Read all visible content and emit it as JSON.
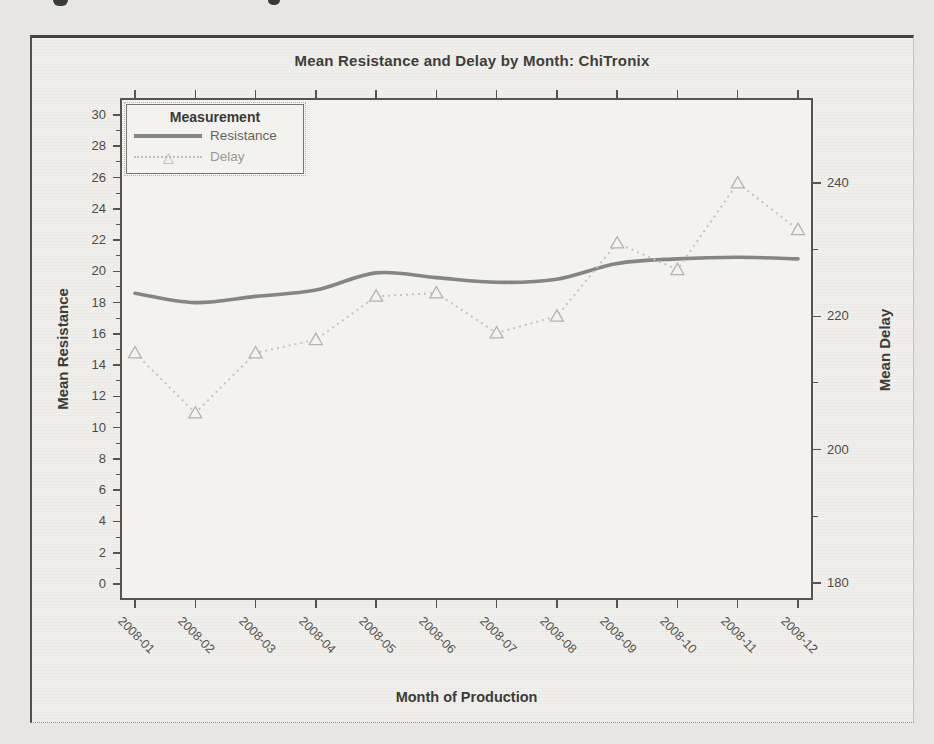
{
  "chart_data": {
    "type": "line",
    "title": "Mean Resistance and Delay by Month: ChiTronix",
    "xlabel": "Month of Production",
    "ylabel_left": "Mean Resistance",
    "ylabel_right": "Mean Delay",
    "categories": [
      "2008-01",
      "2008-02",
      "2008-03",
      "2008-04",
      "2008-05",
      "2008-06",
      "2008-07",
      "2008-08",
      "2008-09",
      "2008-10",
      "2008-11",
      "2008-12"
    ],
    "series": [
      {
        "name": "Resistance",
        "yaxis": "left",
        "line_style": "solid",
        "marker": "none",
        "color": "#858581",
        "values": [
          18.6,
          18.0,
          18.4,
          18.8,
          19.9,
          19.6,
          19.3,
          19.5,
          20.5,
          20.8,
          20.9,
          20.8
        ]
      },
      {
        "name": "Delay",
        "yaxis": "right",
        "line_style": "dotted",
        "marker": "open-triangle",
        "color": "#c4c3bd",
        "marker_color": "#b3b2ac",
        "values": [
          214.5,
          205.5,
          214.5,
          216.5,
          223.0,
          223.5,
          217.5,
          220.0,
          231.0,
          227.0,
          240.0,
          233.0
        ]
      }
    ],
    "left_axis": {
      "label": "Mean Resistance",
      "min": 0,
      "max": 30,
      "major_ticks": [
        0,
        2,
        4,
        6,
        8,
        10,
        12,
        14,
        16,
        18,
        20,
        22,
        24,
        26,
        28,
        30
      ]
    },
    "right_axis": {
      "label": "Mean Delay",
      "min": 180,
      "max": 247,
      "major_ticks": [
        180,
        200,
        220,
        240
      ],
      "minor_ticks": [
        190,
        210,
        230
      ]
    },
    "legend": {
      "title": "Measurement",
      "position": "top-left",
      "entries": [
        "Resistance",
        "Delay"
      ]
    },
    "grid": false
  }
}
